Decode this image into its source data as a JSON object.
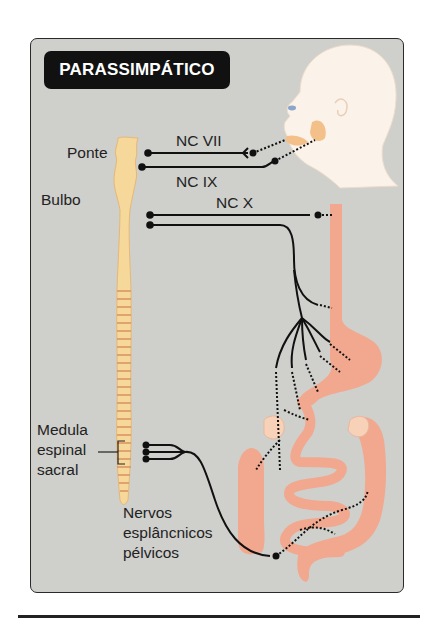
{
  "title": "PARASSIMPÁTICO",
  "labels": {
    "ponte": "Ponte",
    "bulbo": "Bulbo",
    "nc_vii": "NC VII",
    "nc_ix": "NC IX",
    "nc_x": "NC X",
    "medula_line1": "Medula",
    "medula_line2": "espinal",
    "medula_line3": "sacral",
    "nervos_line1": "Nervos",
    "nervos_line2": "esplâncnicos",
    "nervos_line3": "pélvicos"
  },
  "colors": {
    "background_panel": "#cfcfcc",
    "title_badge": "#111111",
    "spinal_cord": "#f6d89a",
    "spinal_stripes": "#d9925f",
    "organ": "#f2a88e",
    "head": "#fbf2ea",
    "gland": "#f3c08a",
    "nerve": "#111111"
  }
}
